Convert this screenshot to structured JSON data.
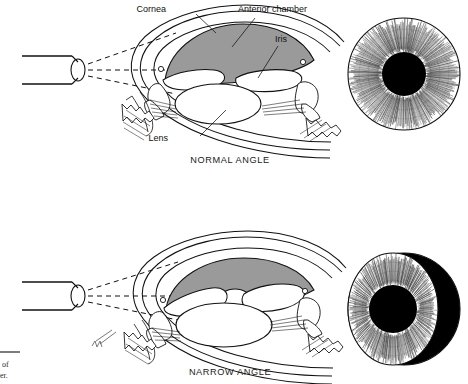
{
  "figure": {
    "background_color": "#ffffff",
    "ink_color": "#111111",
    "anterior_chamber_fill": "#9a9a9a",
    "pupil_fill": "#000000",
    "shadow_fill": "#000000"
  },
  "panels": [
    {
      "id": "normal",
      "caption": "NORMAL ANGLE",
      "labels": [
        {
          "id": "cornea",
          "text": "Cornea"
        },
        {
          "id": "anterior-chamber",
          "text": "Anterior chamber"
        },
        {
          "id": "iris",
          "text": "Iris"
        },
        {
          "id": "lens",
          "text": "Lens"
        }
      ],
      "front_view": {
        "id": "iris-front-normal",
        "shadow": "none",
        "description": "full illuminated iris, no shadow"
      }
    },
    {
      "id": "narrow",
      "caption": "NARROW ANGLE",
      "labels": [],
      "front_view": {
        "id": "iris-front-narrow",
        "shadow": "crescent-right",
        "description": "crescent shadow on nasal side of iris"
      }
    }
  ],
  "penlight": {
    "id": "penlight",
    "ray_count": 3,
    "ray_style": "dashed"
  },
  "figure_caption": {
    "line1": "of",
    "line2": "er."
  }
}
